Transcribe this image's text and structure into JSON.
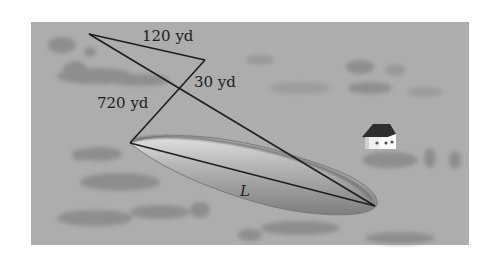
{
  "figure": {
    "labels": {
      "segment_top": "120 yd",
      "segment_short": "30 yd",
      "segment_long": "720 yd",
      "lake_length": "L"
    },
    "colors": {
      "background": "#a9a9a9",
      "lake": "#8a8a8a",
      "lake_highlight": "#d8d8d8",
      "lines": "#1e1e1e",
      "vegetation": "#8f8f8f"
    }
  }
}
